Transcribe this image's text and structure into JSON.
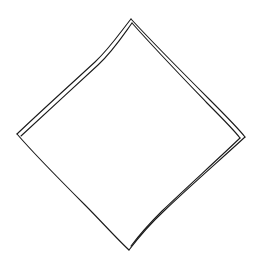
{
  "diagram": {
    "shape": "diamond",
    "style": "hand-drawn sketch",
    "stroke_color": "#1a1a1a",
    "background_color": "#ffffff",
    "vertices": {
      "top": [
        131,
        19
      ],
      "right": [
        245,
        137
      ],
      "bottom": [
        129,
        250
      ],
      "left": [
        17,
        134
      ]
    },
    "double_stroked_edges": [
      "top-left",
      "top-right",
      "bottom-right"
    ],
    "single_stroked_edges": [
      "bottom-left"
    ]
  }
}
